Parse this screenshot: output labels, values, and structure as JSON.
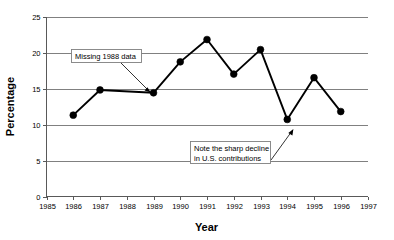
{
  "chart_data": {
    "type": "line",
    "title": "",
    "subtitle": "",
    "xlabel": "Year",
    "ylabel": "Percentage",
    "xlim": [
      1985,
      1997
    ],
    "ylim": [
      0,
      25
    ],
    "xticks": [
      1985,
      1986,
      1987,
      1988,
      1989,
      1990,
      1991,
      1992,
      1993,
      1994,
      1995,
      1996,
      1997
    ],
    "yticks": [
      0,
      5,
      10,
      15,
      20,
      25
    ],
    "xtick_labels": [
      "1985",
      "1986",
      "1987",
      "1988",
      "1989",
      "1990",
      "1991",
      "1992",
      "1993",
      "1994",
      "1995",
      "1996",
      "1997"
    ],
    "ytick_labels": [
      "0",
      "5",
      "10",
      "15",
      "20",
      "25"
    ],
    "grid": "horizontal",
    "legend": "none",
    "missing_x": [
      1988
    ],
    "series": [
      {
        "name": "Percentage",
        "color": "#000000",
        "marker": "filled-circle",
        "x": [
          1986,
          1987,
          1989,
          1990,
          1991,
          1992,
          1993,
          1994,
          1995,
          1996
        ],
        "values": [
          11.3,
          14.8,
          14.4,
          18.7,
          21.8,
          17.0,
          20.4,
          10.7,
          16.5,
          11.8
        ],
        "points": [
          {
            "x": 1986,
            "y": 11.3
          },
          {
            "x": 1987,
            "y": 14.8
          },
          {
            "x": 1989,
            "y": 14.4
          },
          {
            "x": 1990,
            "y": 18.7
          },
          {
            "x": 1991,
            "y": 21.8
          },
          {
            "x": 1992,
            "y": 17.0
          },
          {
            "x": 1993,
            "y": 20.4
          },
          {
            "x": 1994,
            "y": 10.7
          },
          {
            "x": 1995,
            "y": 16.5
          },
          {
            "x": 1996,
            "y": 11.8
          }
        ]
      }
    ],
    "annotations": [
      {
        "id": "missing-1988",
        "text": "Missing 1988 data",
        "target_x": 1988,
        "target_y": 14.6
      },
      {
        "id": "sharp-decline",
        "line1": "Note the sharp decline",
        "line2": "in U.S. contributions",
        "text": "Note the sharp decline in U.S. contributions",
        "target_x": 1994,
        "target_y": 10.7
      }
    ]
  },
  "axes": {
    "y_title": "Percentage",
    "x_title": "Year"
  },
  "y_ticks": [
    {
      "label": "25"
    },
    {
      "label": "20"
    },
    {
      "label": "15"
    },
    {
      "label": "10"
    },
    {
      "label": "5"
    },
    {
      "label": "0"
    }
  ],
  "x_ticks": [
    {
      "label": "1985"
    },
    {
      "label": "1986"
    },
    {
      "label": "1987"
    },
    {
      "label": "1988"
    },
    {
      "label": "1989"
    },
    {
      "label": "1990"
    },
    {
      "label": "1991"
    },
    {
      "label": "1992"
    },
    {
      "label": "1993"
    },
    {
      "label": "1994"
    },
    {
      "label": "1995"
    },
    {
      "label": "1996"
    },
    {
      "label": "1997"
    }
  ],
  "annotations": {
    "missing": {
      "text": "Missing 1988 data"
    },
    "decline": {
      "line1": "Note the sharp decline",
      "line2": "in U.S. contributions"
    }
  },
  "colors": {
    "series": "#000000",
    "gridline": "#808080",
    "axis": "#595959",
    "annotation_border": "#7f7f7f",
    "background": "#ffffff"
  }
}
